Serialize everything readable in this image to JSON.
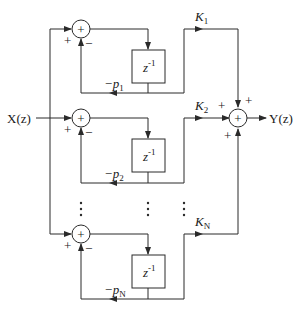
{
  "diagram": {
    "input_label": "X(z)",
    "output_label": "Y(z)",
    "delay_label_base": "z",
    "delay_label_exp": "-1",
    "plus": "+",
    "minus": "–",
    "ellipsis": "⋮",
    "branches": [
      {
        "gain": "K",
        "gain_sub": "1",
        "feedback": "−p",
        "feedback_sub": "1"
      },
      {
        "gain": "K",
        "gain_sub": "2",
        "feedback": "−p",
        "feedback_sub": "2"
      },
      {
        "gain": "K",
        "gain_sub": "N",
        "feedback": "−p",
        "feedback_sub": "N"
      }
    ],
    "colors": {
      "line": "#2a2a2a",
      "text": "#1a1a1a",
      "background": "#ffffff"
    }
  }
}
